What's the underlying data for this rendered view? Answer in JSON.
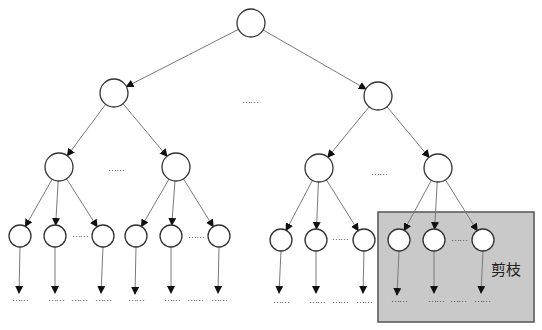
{
  "diagram": {
    "ellipsis": "……",
    "prune_label": "剪枝",
    "colors": {
      "node_stroke": "#333333",
      "edge": "#7a7a7a",
      "prune_fill": "#c9c9c9",
      "prune_border": "#555555"
    },
    "nodes": [
      {
        "id": "root",
        "x": 251,
        "y": 23,
        "r": 14
      },
      {
        "id": "l1-left",
        "x": 114,
        "y": 93,
        "r": 14
      },
      {
        "id": "l1-right",
        "x": 378,
        "y": 96,
        "r": 14
      },
      {
        "id": "l2-ll",
        "x": 59,
        "y": 167,
        "r": 14
      },
      {
        "id": "l2-lr",
        "x": 176,
        "y": 167,
        "r": 14
      },
      {
        "id": "l2-rl",
        "x": 319,
        "y": 168,
        "r": 14
      },
      {
        "id": "l2-rr",
        "x": 438,
        "y": 168,
        "r": 14
      },
      {
        "id": "l3-1",
        "x": 20,
        "y": 236,
        "r": 11
      },
      {
        "id": "l3-2",
        "x": 55,
        "y": 236,
        "r": 11
      },
      {
        "id": "l3-3",
        "x": 103,
        "y": 236,
        "r": 11
      },
      {
        "id": "l3-4",
        "x": 136,
        "y": 236,
        "r": 11
      },
      {
        "id": "l3-5",
        "x": 171,
        "y": 236,
        "r": 11
      },
      {
        "id": "l3-6",
        "x": 219,
        "y": 236,
        "r": 11
      },
      {
        "id": "l3-7",
        "x": 281,
        "y": 240,
        "r": 11
      },
      {
        "id": "l3-8",
        "x": 316,
        "y": 240,
        "r": 11
      },
      {
        "id": "l3-9",
        "x": 364,
        "y": 240,
        "r": 11
      },
      {
        "id": "l3-10",
        "x": 399,
        "y": 240,
        "r": 11
      },
      {
        "id": "l3-11",
        "x": 434,
        "y": 240,
        "r": 11
      },
      {
        "id": "l3-12",
        "x": 483,
        "y": 240,
        "r": 11
      }
    ],
    "edges": [
      [
        "root",
        "l1-left"
      ],
      [
        "root",
        "l1-right"
      ],
      [
        "l1-left",
        "l2-ll"
      ],
      [
        "l1-left",
        "l2-lr"
      ],
      [
        "l1-right",
        "l2-rl"
      ],
      [
        "l1-right",
        "l2-rr"
      ],
      [
        "l2-ll",
        "l3-1"
      ],
      [
        "l2-ll",
        "l3-2"
      ],
      [
        "l2-ll",
        "l3-3"
      ],
      [
        "l2-lr",
        "l3-4"
      ],
      [
        "l2-lr",
        "l3-5"
      ],
      [
        "l2-lr",
        "l3-6"
      ],
      [
        "l2-rl",
        "l3-7"
      ],
      [
        "l2-rl",
        "l3-8"
      ],
      [
        "l2-rl",
        "l3-9"
      ],
      [
        "l2-rr",
        "l3-10"
      ],
      [
        "l2-rr",
        "l3-11"
      ],
      [
        "l2-rr",
        "l3-12"
      ]
    ],
    "leaf_arrows": [
      {
        "from": "l3-1",
        "x2": 19,
        "y2": 293
      },
      {
        "from": "l3-2",
        "x2": 55,
        "y2": 293
      },
      {
        "from": "l3-3",
        "x2": 101,
        "y2": 293
      },
      {
        "from": "l3-4",
        "x2": 135,
        "y2": 294
      },
      {
        "from": "l3-5",
        "x2": 171,
        "y2": 293
      },
      {
        "from": "l3-6",
        "x2": 218,
        "y2": 293
      },
      {
        "from": "l3-7",
        "x2": 279,
        "y2": 293
      },
      {
        "from": "l3-8",
        "x2": 316,
        "y2": 293
      },
      {
        "from": "l3-9",
        "x2": 363,
        "y2": 293
      },
      {
        "from": "l3-10",
        "x2": 397,
        "y2": 295
      },
      {
        "from": "l3-11",
        "x2": 434,
        "y2": 293
      },
      {
        "from": "l3-12",
        "x2": 481,
        "y2": 293
      }
    ],
    "ellipses": [
      {
        "x": 242,
        "y": 103
      },
      {
        "x": 108,
        "y": 171
      },
      {
        "x": 371,
        "y": 175
      },
      {
        "x": 72,
        "y": 237
      },
      {
        "x": 188,
        "y": 238
      },
      {
        "x": 332,
        "y": 240
      },
      {
        "x": 451,
        "y": 241
      },
      {
        "x": 12,
        "y": 301
      },
      {
        "x": 48,
        "y": 301
      },
      {
        "x": 71,
        "y": 301
      },
      {
        "x": 95,
        "y": 301
      },
      {
        "x": 128,
        "y": 301
      },
      {
        "x": 164,
        "y": 301
      },
      {
        "x": 187,
        "y": 301
      },
      {
        "x": 211,
        "y": 301
      },
      {
        "x": 273,
        "y": 303
      },
      {
        "x": 309,
        "y": 303
      },
      {
        "x": 332,
        "y": 303
      },
      {
        "x": 356,
        "y": 303
      },
      {
        "x": 391,
        "y": 302
      },
      {
        "x": 428,
        "y": 302
      },
      {
        "x": 450,
        "y": 302
      },
      {
        "x": 474,
        "y": 302
      }
    ],
    "prune_box": {
      "x": 378,
      "y": 212,
      "width": 156,
      "height": 110,
      "label_x": 506,
      "label_y": 275
    }
  }
}
